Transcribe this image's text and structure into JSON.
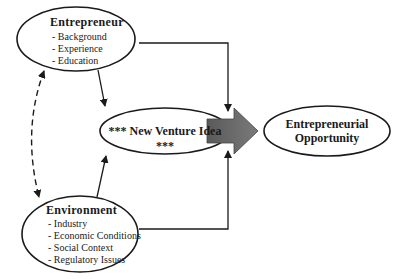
{
  "nodes": {
    "entrepreneur": {
      "title": "Entrepreneur",
      "items": [
        "- Background",
        "- Experience",
        "- Education"
      ]
    },
    "environment": {
      "title": "Environment",
      "items": [
        "- Industry",
        "- Economic Conditions",
        "- Social Context",
        "- Regulatory Issues"
      ]
    },
    "new_venture_idea": {
      "title": "*** New Venture Idea ***"
    },
    "opportunity": {
      "line1": "Entrepreneurial",
      "line2": "Opportunity"
    }
  },
  "colors": {
    "stroke": "#1a1a1a",
    "block_arrow_fill": "#6e6e6e"
  }
}
